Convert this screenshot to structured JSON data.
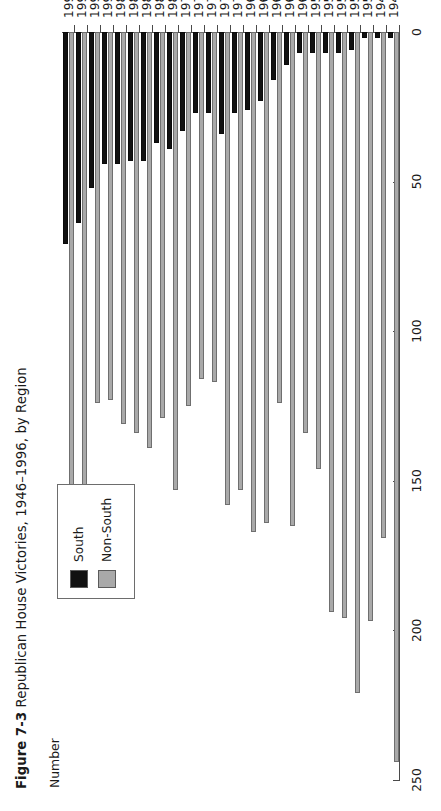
{
  "figure": {
    "label": "Figure 7-3",
    "caption": "Republican House Victories, 1946–1996, by Region"
  },
  "axis": {
    "value_axis_title": "Number",
    "tick_labels": [
      "250",
      "200",
      "150",
      "100",
      "50",
      "0"
    ],
    "tick_values": [
      250,
      200,
      150,
      100,
      50,
      0
    ]
  },
  "legend": {
    "items": [
      {
        "label": "South",
        "color": "#111111"
      },
      {
        "label": "Non-South",
        "color": "#a9a9a9"
      }
    ]
  },
  "colors": {
    "south": "#111111",
    "non_south": "#a9a9a9",
    "axis": "#4a4a4a",
    "background": "#ffffff"
  },
  "chart_data": {
    "type": "bar",
    "orientation": "horizontal",
    "title": "Republican House Victories, 1946–1996, by Region",
    "xlabel": "Number",
    "ylabel": "",
    "xlim": [
      0,
      250
    ],
    "grid": false,
    "legend_position": "upper-left",
    "categories": [
      "1946",
      "1948",
      "1950",
      "1952",
      "1954",
      "1956",
      "1958",
      "1960",
      "1962",
      "1964",
      "1966",
      "1968",
      "1970",
      "1972",
      "1974",
      "1976",
      "1978",
      "1980",
      "1982",
      "1984",
      "1986",
      "1988",
      "1990",
      "1992",
      "1994",
      "1996"
    ],
    "series": [
      {
        "name": "South",
        "color": "#111111",
        "values": [
          2,
          2,
          2,
          6,
          7,
          7,
          7,
          7,
          11,
          16,
          23,
          26,
          27,
          34,
          27,
          27,
          33,
          39,
          37,
          43,
          43,
          44,
          44,
          52,
          64,
          71
        ]
      },
      {
        "name": "Non-South",
        "color": "#a9a9a9",
        "values": [
          244,
          169,
          197,
          221,
          196,
          194,
          146,
          134,
          165,
          124,
          164,
          167,
          153,
          158,
          117,
          116,
          125,
          153,
          129,
          139,
          134,
          131,
          123,
          124,
          166,
          156
        ]
      }
    ]
  }
}
